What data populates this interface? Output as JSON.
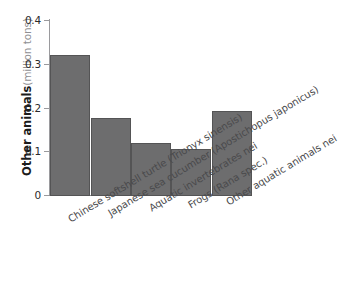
{
  "chart_data": {
    "type": "bar",
    "title": "",
    "subtitle": "",
    "xlabel": "",
    "ylabel": "Other animals",
    "ylabel_unit": "(million tons)",
    "ylim": [
      0,
      0.4
    ],
    "yticks": [
      "0.4",
      "0.3",
      "0.2",
      "0.1",
      "0"
    ],
    "ytick_values": [
      0.4,
      0.3,
      0.2,
      0.1,
      0
    ],
    "grid": false,
    "legend": "none",
    "bar_color": "#6d6d6e",
    "bar_border_color": "#545455",
    "axis_color": "#9a9a9d",
    "categories": [
      "Chinese softshell turtle (Trionyx sinensis)",
      "Japanese sea cucumber (Apostichopus japonicus)",
      "Aquatic invertebrates nei",
      "Frogs (Rana spec.)",
      "Other aquatic animals nei"
    ],
    "values": [
      0.32,
      0.176,
      0.12,
      0.105,
      0.191
    ],
    "series": [
      {
        "name": "Other animals",
        "values": [
          0.32,
          0.176,
          0.12,
          0.105,
          0.191
        ]
      }
    ]
  }
}
